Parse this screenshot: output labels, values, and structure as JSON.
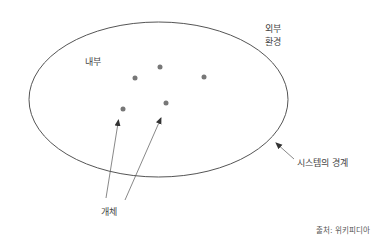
{
  "diagram": {
    "labels": {
      "inside": "내부",
      "outside_line1": "외부",
      "outside_line2": "환경",
      "boundary": "시스템의 경계",
      "entities": "개체",
      "source": "출처: 위키피디아"
    },
    "colors": {
      "ellipse_stroke": "#555555",
      "dot_fill": "#777777",
      "arrow": "#444444",
      "text": "#444444"
    },
    "ellipse": {
      "cx": 158.5,
      "cy": 99.5,
      "rx": 129.5,
      "ry": 77.5
    },
    "dots": [
      {
        "x": 135,
        "y": 78
      },
      {
        "x": 160,
        "y": 67
      },
      {
        "x": 204,
        "y": 77
      },
      {
        "x": 123,
        "y": 109
      },
      {
        "x": 166,
        "y": 103
      }
    ]
  }
}
